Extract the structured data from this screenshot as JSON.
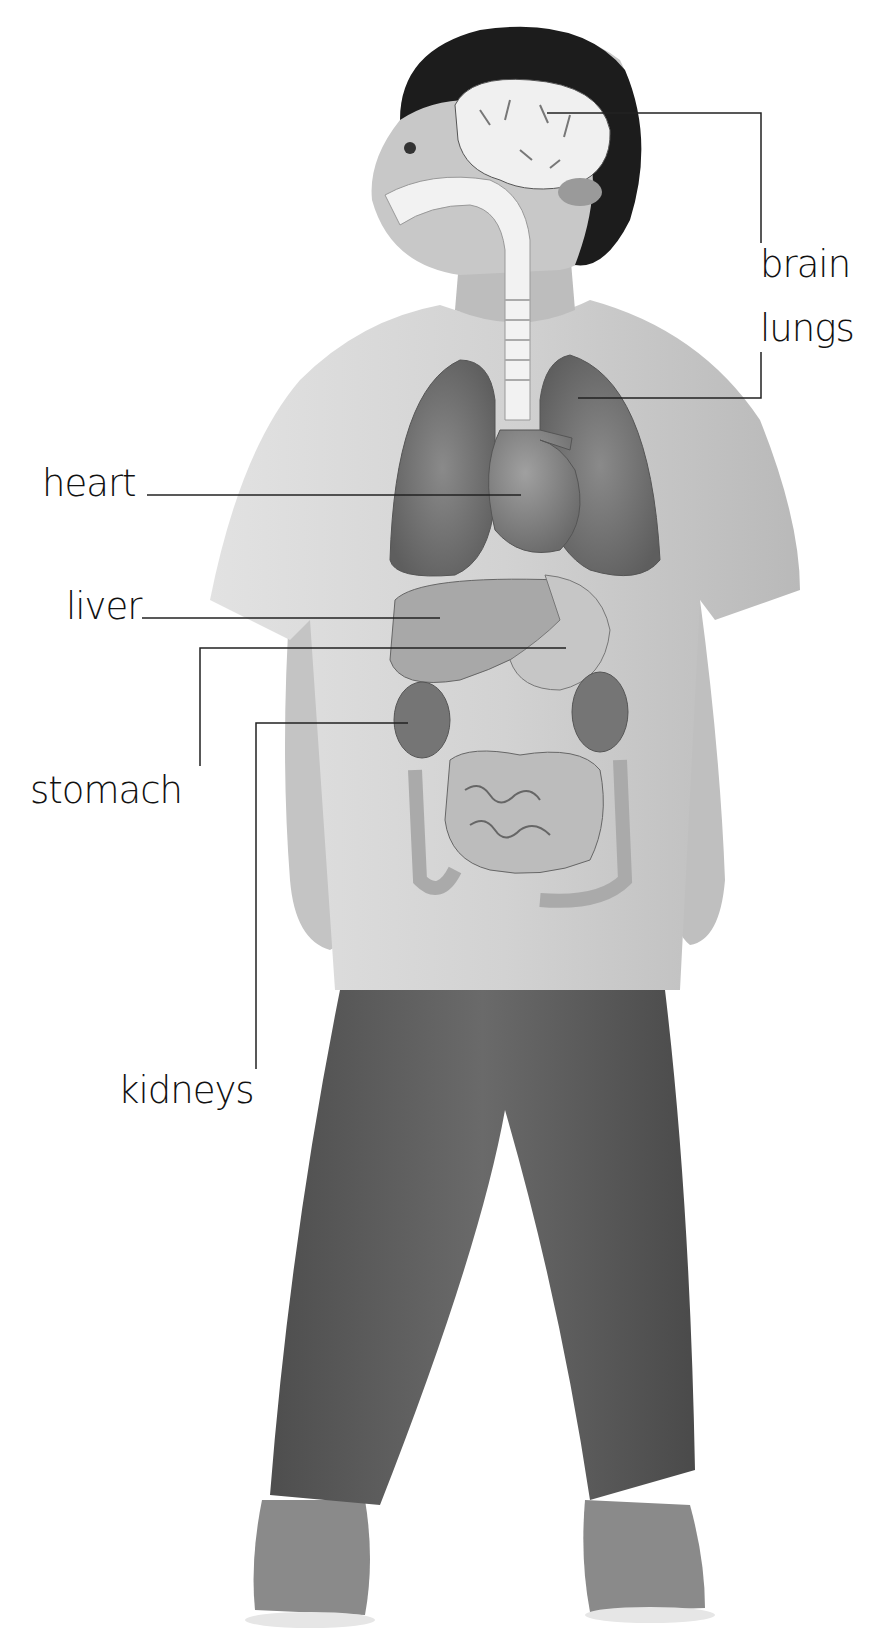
{
  "diagram": {
    "labels": [
      {
        "id": "brain",
        "text": "brain",
        "x": 760,
        "y": 246
      },
      {
        "id": "lungs",
        "text": "lungs",
        "x": 760,
        "y": 310
      },
      {
        "id": "heart",
        "text": "heart",
        "x": 42,
        "y": 465
      },
      {
        "id": "liver",
        "text": "liver",
        "x": 66,
        "y": 588
      },
      {
        "id": "stomach",
        "text": "stomach",
        "x": 30,
        "y": 772
      },
      {
        "id": "kidneys",
        "text": "kidneys",
        "x": 118,
        "y": 1072
      }
    ],
    "leaders": {
      "brain": "M547,113 L761,113 L761,243",
      "lungs": "M578,398 L761,398 L761,352",
      "heart": "M147,495 L521,495",
      "liver": "M142,618 L440,618",
      "stomach": "M566,648 L200,648 L200,766",
      "kidneys": "M408,723 L256,723 L256,1069"
    },
    "colors": {
      "background": "#ffffff",
      "label_text": "#111111",
      "leader_line": "#222222",
      "hair": "#1c1c1c",
      "skin": "#c9c9c9",
      "shirt": "#d6d6d6",
      "jeans": "#5a5a5a",
      "boots": "#8c8c8c",
      "lungs": "#6f6f6f",
      "heart": "#7e7e7e",
      "liver": "#a8a8a8",
      "stomach": "#c4c4c4",
      "kidneys": "#767676",
      "intestines": "#bdbdbd",
      "brain": "#f0f0f0",
      "trachea": "#f4f4f4"
    }
  }
}
